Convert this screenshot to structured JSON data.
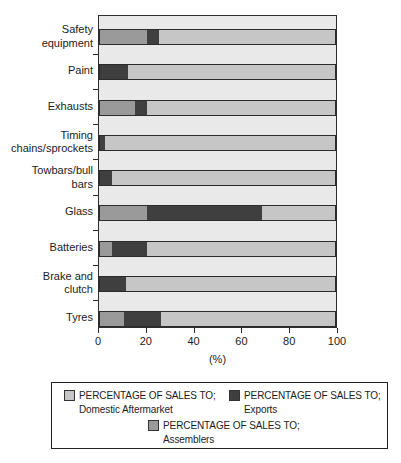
{
  "chart_data": {
    "type": "bar",
    "orientation": "horizontal",
    "stacked": true,
    "categories": [
      "Safety equipment",
      "Paint",
      "Exhausts",
      "Timing chains/sprockets",
      "Towbars/bull bars",
      "Glass",
      "Batteries",
      "Brake and clutch",
      "Tyres"
    ],
    "category_label_lines": [
      [
        "Safety",
        "equipment"
      ],
      [
        "Paint"
      ],
      [
        "Exhausts"
      ],
      [
        "Timing",
        "chains/sprockets"
      ],
      [
        "Towbars/bull",
        "bars"
      ],
      [
        "Glass"
      ],
      [
        "Batteries"
      ],
      [
        "Brake and",
        "clutch"
      ],
      [
        "Tyres"
      ]
    ],
    "series": [
      {
        "name": "PERCENTAGE OF SALES TO; Assemblers",
        "color": "#9a9a9a",
        "values": [
          20,
          0,
          15,
          0,
          0,
          20,
          5,
          0,
          10
        ]
      },
      {
        "name": "PERCENTAGE OF SALES TO; Exports",
        "color": "#3f3f3f",
        "values": [
          5,
          12,
          5,
          2,
          5,
          49,
          15,
          11,
          16
        ]
      },
      {
        "name": "PERCENTAGE OF SALES TO; Domestic Aftermarket",
        "color": "#c6c6c6",
        "values": [
          75,
          88,
          80,
          98,
          95,
          31,
          80,
          89,
          74
        ]
      }
    ],
    "xlabel": "(%)",
    "x_ticks": [
      0,
      20,
      40,
      60,
      80,
      100
    ],
    "xlim": [
      0,
      100
    ],
    "grid": false,
    "plot_background": "#e9e9e9",
    "legend": {
      "position": "bottom",
      "entries": [
        {
          "label_line1": "PERCENTAGE OF SALES TO;",
          "label_line2": "Domestic Aftermarket",
          "color": "#c6c6c6"
        },
        {
          "label_line1": "PERCENTAGE OF SALES TO;",
          "label_line2": "Exports",
          "color": "#3f3f3f"
        },
        {
          "label_line1": "PERCENTAGE OF SALES TO;",
          "label_line2": "Assemblers",
          "color": "#9a9a9a"
        }
      ]
    }
  }
}
